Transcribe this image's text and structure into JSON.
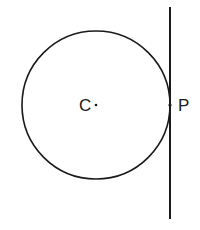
{
  "diagram": {
    "type": "circle-with-tangent-line",
    "circle": {
      "cx": 96,
      "cy": 105,
      "r": 74,
      "stroke": "#1a1a1a"
    },
    "tangent_line": {
      "x": 170,
      "y1": 7,
      "y2": 219,
      "stroke": "#1a1a1a"
    },
    "points": [
      {
        "label": "C",
        "role": "center",
        "x": 96,
        "y": 105
      },
      {
        "label": "P",
        "role": "point-of-tangency",
        "x": 170,
        "y": 105
      }
    ]
  },
  "labels": {
    "center": "C",
    "tangent_point": "P"
  }
}
